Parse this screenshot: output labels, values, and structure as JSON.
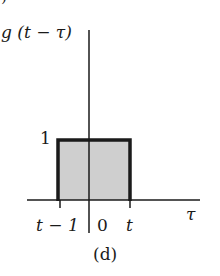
{
  "figure": {
    "function_label": "g (t − τ)",
    "height_label": "1",
    "axis_label": "τ",
    "ticks": [
      {
        "label": "t − 1",
        "x": 58
      },
      {
        "label": "0",
        "x": 89
      },
      {
        "label": "t",
        "x": 130
      }
    ],
    "caption": "(d)",
    "fragment": ")"
  },
  "colors": {
    "ink": "#1a1a1a",
    "fill": "#cfcfcf",
    "background": "#ffffff"
  }
}
